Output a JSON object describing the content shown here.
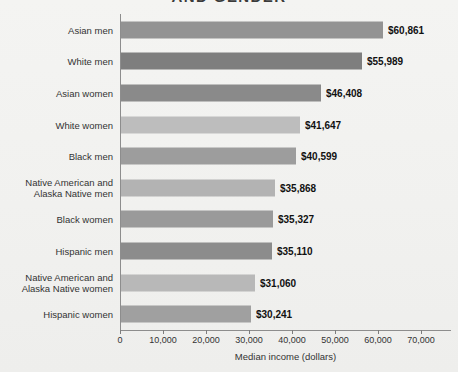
{
  "chart_data": {
    "type": "bar",
    "orientation": "horizontal",
    "title": "AND GENDER",
    "xlabel": "Median income (dollars)",
    "ylabel": "",
    "xlim": [
      0,
      70000
    ],
    "xticks": [
      0,
      10000,
      20000,
      30000,
      40000,
      50000,
      60000,
      70000
    ],
    "xtick_labels": [
      "0",
      "10,000",
      "20,000",
      "30,000",
      "40,000",
      "50,000",
      "60,000",
      "70,000"
    ],
    "grid": false,
    "legend": null,
    "categories": [
      "Asian men",
      "White men",
      "Asian women",
      "White women",
      "Black men",
      "Native American and Alaska Native men",
      "Black women",
      "Hispanic men",
      "Native American and Alaska Native women",
      "Hispanic women"
    ],
    "values": [
      60861,
      55989,
      46408,
      41647,
      40599,
      35868,
      35327,
      35110,
      31060,
      30241
    ],
    "value_labels": [
      "$60,861",
      "$55,989",
      "$46,408",
      "$41,647",
      "$40,599",
      "$35,868",
      "$35,327",
      "$35,110",
      "$31,060",
      "$30,241"
    ],
    "bar_colors": [
      "#939393",
      "#7e7e7e",
      "#8a8a8a",
      "#bdbdbd",
      "#9d9d9d",
      "#b3b3b3",
      "#9a9a9a",
      "#8c8c8c",
      "#b8b8b8",
      "#a0a0a0"
    ]
  },
  "rows": [
    {
      "line1": "Asian men",
      "line2": "",
      "value_label": "$60,861",
      "value": 60861,
      "color": "#939393"
    },
    {
      "line1": "White men",
      "line2": "",
      "value_label": "$55,989",
      "value": 55989,
      "color": "#7e7e7e"
    },
    {
      "line1": "Asian women",
      "line2": "",
      "value_label": "$46,408",
      "value": 46408,
      "color": "#8a8a8a"
    },
    {
      "line1": "White women",
      "line2": "",
      "value_label": "$41,647",
      "value": 41647,
      "color": "#bdbdbd"
    },
    {
      "line1": "Black men",
      "line2": "",
      "value_label": "$40,599",
      "value": 40599,
      "color": "#9d9d9d"
    },
    {
      "line1": "Native American and",
      "line2": "Alaska Native men",
      "value_label": "$35,868",
      "value": 35868,
      "color": "#b3b3b3"
    },
    {
      "line1": "Black women",
      "line2": "",
      "value_label": "$35,327",
      "value": 35327,
      "color": "#9a9a9a"
    },
    {
      "line1": "Hispanic men",
      "line2": "",
      "value_label": "$35,110",
      "value": 35110,
      "color": "#8c8c8c"
    },
    {
      "line1": "Native American and",
      "line2": "Alaska Native women",
      "value_label": "$31,060",
      "value": 31060,
      "color": "#b8b8b8"
    },
    {
      "line1": "Hispanic women",
      "line2": "",
      "value_label": "$30,241",
      "value": 30241,
      "color": "#a0a0a0"
    }
  ],
  "axis": {
    "title": "Median income (dollars)",
    "ticks": [
      "0",
      "10,000",
      "20,000",
      "30,000",
      "40,000",
      "50,000",
      "60,000",
      "70,000"
    ]
  },
  "header": {
    "title": "AND GENDER"
  }
}
